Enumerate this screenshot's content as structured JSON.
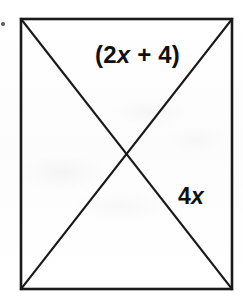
{
  "figure": {
    "name": "rectangle-with-diagonals",
    "background_color": "#fdfdfd",
    "stroke_color": "#1a1a1a",
    "text_color": "#101010"
  },
  "shape": {
    "type": "rectangle",
    "left": 21,
    "top": 19,
    "right": 232,
    "bottom": 289,
    "width": 211,
    "height": 270,
    "border_width": 2.6,
    "diagonals": [
      {
        "name": "diagonal-top-left-to-bottom-right",
        "x1": 21,
        "y1": 19,
        "x2": 232,
        "y2": 289
      },
      {
        "name": "diagonal-top-right-to-bottom-left",
        "x1": 232,
        "y1": 19,
        "x2": 21,
        "y2": 289
      }
    ],
    "diagonal_width": 2.2,
    "intersection": {
      "x": 126.5,
      "y": 154
    }
  },
  "labels": {
    "top": {
      "name": "expression-2x-plus-4",
      "prefix": "(2",
      "variable": "x",
      "suffix": " + 4)",
      "full_text": "(2x + 4)"
    },
    "right": {
      "name": "expression-4x",
      "prefix": "4",
      "variable": "x",
      "suffix": "",
      "full_text": "4x"
    }
  },
  "artifacts": {
    "edge_speck": "scan-speck"
  }
}
